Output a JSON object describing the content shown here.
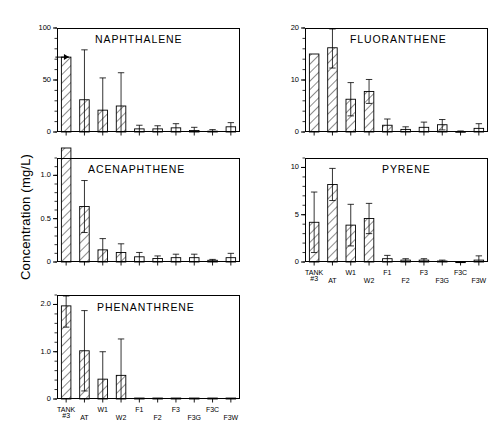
{
  "figure": {
    "axis_title_y": "Concentration (mg/L)",
    "categories": [
      "TANK #3",
      "AT",
      "W1",
      "W2",
      "F1",
      "F2",
      "F3",
      "F3G",
      "F3C",
      "F3W"
    ],
    "category_lines": [
      [
        "TANK",
        "#3"
      ],
      [
        "AT",
        ""
      ],
      [
        "W1",
        ""
      ],
      [
        "W2",
        ""
      ],
      [
        "F1",
        ""
      ],
      [
        "F2",
        ""
      ],
      [
        "F3",
        ""
      ],
      [
        "F3G",
        ""
      ],
      [
        "F3C",
        ""
      ],
      [
        "F3W",
        ""
      ]
    ]
  },
  "chart_data": [
    {
      "type": "bar",
      "title": "NAPHTHALENE",
      "panel": "naphthalene",
      "xlabel": "",
      "ylabel": "Concentration (mg/L)",
      "ylim": [
        0,
        100
      ],
      "yticks": [
        0,
        50,
        100
      ],
      "ytick_labels": [
        "0",
        "50",
        "100"
      ],
      "minor_ticks": true,
      "grid": false,
      "categories": [
        "TANK #3",
        "AT",
        "W1",
        "W2",
        "F1",
        "F2",
        "F3",
        "F3G",
        "F3C",
        "F3W"
      ],
      "values": [
        72,
        31,
        21,
        25,
        3,
        3,
        4,
        1.5,
        0.8,
        5
      ],
      "errors": [
        0,
        48,
        31,
        32,
        3.5,
        3,
        4,
        3,
        1.5,
        4
      ],
      "clipped_first_bar": true,
      "note": "first bar topped with up-arrow marker (value off scale / censored)"
    },
    {
      "type": "bar",
      "title": "FLUORANTHENE",
      "panel": "fluoranthene",
      "xlabel": "",
      "ylabel": "",
      "ylim": [
        0,
        20
      ],
      "yticks": [
        0,
        10,
        20
      ],
      "ytick_labels": [
        "0",
        "10",
        "20"
      ],
      "minor_ticks": true,
      "grid": false,
      "categories": [
        "TANK #3",
        "AT",
        "W1",
        "W2",
        "F1",
        "F2",
        "F3",
        "F3G",
        "F3C",
        "F3W"
      ],
      "values": [
        15,
        16.2,
        6.3,
        7.8,
        1.3,
        0.5,
        0.9,
        1.4,
        0.1,
        0.7
      ],
      "errors": [
        0,
        3.9,
        3.2,
        2.3,
        1.2,
        0.5,
        1.0,
        1.0,
        0.1,
        0.9
      ],
      "clipped_first_bar": false
    },
    {
      "type": "bar",
      "title": "ACENAPHTHENE",
      "panel": "acenaphthene",
      "xlabel": "",
      "ylabel": "Concentration (mg/L)",
      "ylim": [
        0,
        1.2
      ],
      "yticks": [
        0,
        0.5,
        1.0
      ],
      "ytick_labels": [
        "0",
        "0.5",
        "1.0"
      ],
      "minor_ticks": true,
      "grid": false,
      "categories": [
        "TANK #3",
        "AT",
        "W1",
        "W2",
        "F1",
        "F2",
        "F3",
        "F3G",
        "F3C",
        "F3W"
      ],
      "values": [
        1.3,
        0.64,
        0.14,
        0.11,
        0.06,
        0.04,
        0.05,
        0.05,
        0.02,
        0.05
      ],
      "errors": [
        0,
        0.3,
        0.13,
        0.1,
        0.05,
        0.03,
        0.04,
        0.04,
        0.01,
        0.05
      ],
      "clipped_first_bar": true,
      "note": "first bar exceeds top of plot frame"
    },
    {
      "type": "bar",
      "title": "PYRENE",
      "panel": "pyrene",
      "xlabel": "",
      "ylabel": "",
      "ylim": [
        0,
        11
      ],
      "yticks": [
        0,
        5,
        10
      ],
      "ytick_labels": [
        "0",
        "5",
        "10"
      ],
      "minor_ticks": true,
      "grid": false,
      "categories": [
        "TANK #3",
        "AT",
        "W1",
        "W2",
        "F1",
        "F2",
        "F3",
        "F3G",
        "F3C",
        "F3W"
      ],
      "values": [
        4.2,
        8.2,
        3.9,
        4.6,
        0.35,
        0.2,
        0.2,
        0.1,
        0.02,
        0.2
      ],
      "errors": [
        3.2,
        1.7,
        2.2,
        1.6,
        0.35,
        0.15,
        0.15,
        0.1,
        0.02,
        0.45
      ],
      "clipped_first_bar": false
    },
    {
      "type": "bar",
      "title": "PHENANTHRENE",
      "panel": "phenanthrene",
      "xlabel": "",
      "ylabel": "Concentration (mg/L)",
      "ylim": [
        0,
        2.2
      ],
      "yticks": [
        0,
        1.0,
        2.0
      ],
      "ytick_labels": [
        "0",
        "1.0",
        "2.0"
      ],
      "minor_ticks": true,
      "grid": false,
      "categories": [
        "TANK #3",
        "AT",
        "W1",
        "W2",
        "F1",
        "F2",
        "F3",
        "F3G",
        "F3C",
        "F3W"
      ],
      "values": [
        1.97,
        1.02,
        0.42,
        0.5,
        0.02,
        0.02,
        0.02,
        0.02,
        0.02,
        0.02
      ],
      "errors": [
        0.45,
        0.85,
        0.58,
        0.77,
        0,
        0,
        0,
        0,
        0,
        0
      ],
      "clipped_first_bar": false
    }
  ]
}
